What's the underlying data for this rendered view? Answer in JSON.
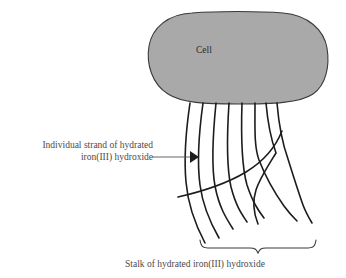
{
  "figure": {
    "title_text": "Cell",
    "background_color": "#ffffff",
    "cell": {
      "label": "Cell",
      "fill_color": "#a9a9a9",
      "stroke_color": "#3a3a3a",
      "bounds": {
        "x": 148,
        "y": 12,
        "width": 180,
        "height": 91
      }
    },
    "annotation": {
      "line1": "Individual strand of hydrated",
      "line2": "iron(III) hydroxide",
      "arrow_color": "#555555",
      "arrow_from_x": 152,
      "arrow_to_x": 198,
      "arrow_y": 157
    },
    "caption": {
      "text": "Stalk of hydrated iron(III) hydroxide",
      "brace_color": "#3a3a3a",
      "brace_left_x": 200,
      "brace_right_x": 316,
      "brace_y": 247
    },
    "strands": {
      "color": "#1c1c1c",
      "count": 8,
      "top_y": 103,
      "stroke_width": 1.6,
      "paths": [
        "M190,103 C186,130 184,160 186,182 C188,206 196,226 205,243",
        "M203,103 C199,132 197,163 200,185 C203,208 211,224 219,238",
        "M216,103 C213,133 211,164 215,186 C219,207 226,218 233,229",
        "M229,103 C227,134 226,165 231,187 C236,206 241,213 247,222",
        "M242,103 C241,134 241,164 247,185 C253,203 258,210 264,218",
        "M255,103 C255,128 254,146 259,160 C266,178 274,192 284,206 C289,213 293,217 297,221",
        "M266,103 C268,126 272,142 276,153 C268,166 260,178 256,190 C252,202 254,214 258,224",
        "M277,103 C279,127 283,145 288,159 C293,175 298,191 303,205 C306,213 309,218 312,223"
      ],
      "crossing_path": "M178,197 C200,192 226,184 246,172 C264,161 276,146 282,131"
    }
  }
}
